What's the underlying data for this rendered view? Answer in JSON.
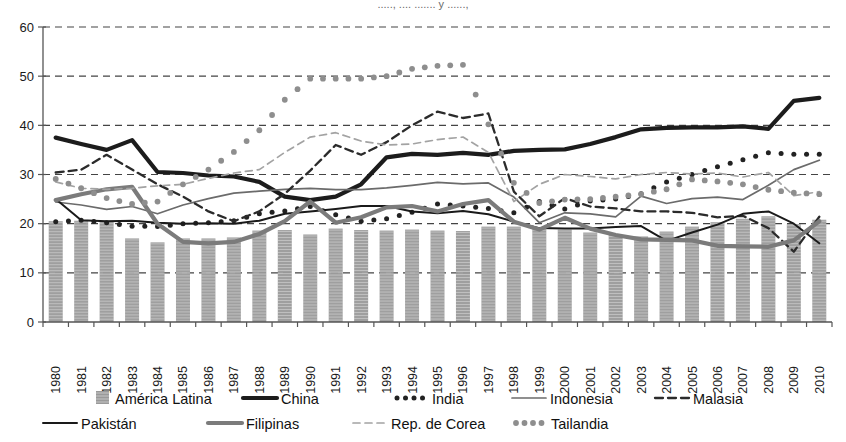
{
  "title_truncated": "....., .... ....... y ......,",
  "chart_data": {
    "type": "line",
    "title": "",
    "xlabel": "",
    "ylabel": "",
    "ylim": [
      0,
      60
    ],
    "yticks": [
      0,
      10,
      20,
      30,
      40,
      50,
      60
    ],
    "grid": true,
    "legend_position": "bottom",
    "categories": [
      "1980",
      "1981",
      "1982",
      "1983",
      "1984",
      "1985",
      "1986",
      "1987",
      "1988",
      "1989",
      "1990",
      "1991",
      "1992",
      "1993",
      "1994",
      "1995",
      "1996",
      "1997",
      "1998",
      "1999",
      "2000",
      "2001",
      "2002",
      "2003",
      "2004",
      "2005",
      "2006",
      "2007",
      "2008",
      "2009",
      "2010"
    ],
    "series": [
      {
        "name": "América Latina",
        "type": "bar",
        "style": "bar-gray-hatch",
        "color": "#9a9a9a",
        "values": [
          20.5,
          20.6,
          20.4,
          17.0,
          16.2,
          17.0,
          17.0,
          17.2,
          18.6,
          18.7,
          17.8,
          19.0,
          18.7,
          18.6,
          18.8,
          18.6,
          18.5,
          19.4,
          19.4,
          19.0,
          18.8,
          18.2,
          17.7,
          17.4,
          18.4,
          19.4,
          20.3,
          21.0,
          21.5,
          19.9,
          20.8
        ]
      },
      {
        "name": "China",
        "type": "line",
        "style": "solid-thick-black",
        "color": "#1c1c1c",
        "values": [
          37.5,
          36.2,
          35.0,
          37.0,
          30.5,
          30.3,
          29.8,
          29.6,
          28.5,
          25.5,
          24.8,
          25.5,
          28.0,
          33.5,
          34.2,
          34.0,
          34.4,
          34.0,
          34.8,
          35.0,
          35.1,
          36.2,
          37.6,
          39.2,
          39.5,
          39.6,
          39.6,
          39.8,
          39.3,
          45.0,
          45.6
        ]
      },
      {
        "name": "India",
        "type": "line",
        "style": "dotted-thick-black",
        "color": "#222222",
        "values": [
          20.4,
          20.7,
          20.2,
          19.5,
          19.4,
          20.0,
          20.2,
          20.6,
          22.0,
          22.6,
          23.5,
          21.8,
          20.5,
          21.0,
          22.3,
          24.0,
          23.6,
          23.1,
          22.2,
          24.5,
          23.0,
          24.6,
          25.0,
          26.1,
          28.5,
          30.0,
          31.6,
          33.0,
          34.4,
          34.1,
          34.1
        ]
      },
      {
        "name": "Indonesia",
        "type": "line",
        "style": "solid-thin-gray",
        "color": "#6b6b6b",
        "values": [
          24.4,
          23.8,
          22.9,
          23.5,
          22.0,
          23.8,
          25.1,
          26.2,
          26.6,
          27.0,
          27.2,
          26.9,
          26.9,
          27.3,
          27.8,
          28.4,
          28.1,
          28.3,
          25.4,
          20.2,
          22.2,
          22.0,
          21.4,
          25.6,
          24.1,
          25.1,
          25.4,
          24.9,
          27.8,
          31.0,
          32.9
        ]
      },
      {
        "name": "Malasia",
        "type": "line",
        "style": "dashed-dark",
        "color": "#2b2b2b",
        "values": [
          30.4,
          31.0,
          34.0,
          31.0,
          28.0,
          25.5,
          22.5,
          20.5,
          22.5,
          26.1,
          30.8,
          36.0,
          34.0,
          36.6,
          40.0,
          42.8,
          41.5,
          42.4,
          26.5,
          21.5,
          25.2,
          23.5,
          23.1,
          22.5,
          22.5,
          22.2,
          21.3,
          21.6,
          19.1,
          14.3,
          21.4
        ]
      },
      {
        "name": "Pakistán",
        "type": "line",
        "style": "solid-thin-black",
        "color": "#1a1a1a",
        "values": [
          25.0,
          20.7,
          20.5,
          20.6,
          20.2,
          20.0,
          20.1,
          20.0,
          20.6,
          22.0,
          22.5,
          23.0,
          23.6,
          23.6,
          22.5,
          22.1,
          22.6,
          21.9,
          20.4,
          19.1,
          19.0,
          19.0,
          19.3,
          19.5,
          16.5,
          18.2,
          19.8,
          22.0,
          22.5,
          20.0,
          16.0
        ]
      },
      {
        "name": "Filipinas",
        "type": "line",
        "style": "solid-thick-gray",
        "color": "#7b7b7b",
        "values": [
          24.8,
          26.0,
          27.0,
          27.5,
          20.0,
          16.3,
          16.0,
          16.3,
          17.9,
          20.5,
          24.5,
          20.2,
          21.3,
          23.3,
          23.6,
          22.5,
          24.0,
          24.8,
          20.4,
          18.8,
          21.2,
          19.0,
          17.7,
          16.8,
          16.7,
          16.6,
          15.5,
          15.4,
          15.3,
          16.6,
          20.5
        ]
      },
      {
        "name": "Rep. de Corea",
        "type": "line",
        "style": "dashed-light",
        "color": "#a3a3a3",
        "values": [
          28.5,
          27.2,
          27.0,
          27.2,
          27.7,
          28.0,
          29.2,
          30.3,
          31.0,
          34.5,
          37.6,
          38.5,
          36.8,
          36.0,
          36.2,
          37.1,
          37.6,
          34.5,
          24.5,
          28.0,
          30.0,
          29.6,
          29.1,
          30.0,
          30.4,
          30.1,
          30.3,
          29.5,
          30.4,
          25.7,
          26.5
        ]
      },
      {
        "name": "Tailandia",
        "type": "line",
        "style": "dotted-thick-gray",
        "color": "#8e8e8e",
        "values": [
          29.1,
          27.2,
          25.2,
          24.0,
          24.5,
          28.0,
          31.0,
          34.6,
          39.0,
          45.2,
          49.5,
          49.5,
          49.5,
          50.0,
          51.5,
          52.1,
          52.3,
          40.2,
          28.3,
          24.2,
          24.9,
          25.0,
          25.5,
          26.0,
          27.0,
          29.0,
          28.6,
          28.0,
          26.9,
          26.3,
          26.0
        ]
      }
    ],
    "legend": [
      {
        "label": "América Latina",
        "marker": "bar-gray-hatch",
        "color": "#9a9a9a"
      },
      {
        "label": "China",
        "marker": "solid-thick-black",
        "color": "#1c1c1c"
      },
      {
        "label": "India",
        "marker": "dotted-thick-black",
        "color": "#222222"
      },
      {
        "label": "Indonesia",
        "marker": "solid-thin-gray",
        "color": "#6b6b6b"
      },
      {
        "label": "Malasia",
        "marker": "dashed-dark",
        "color": "#2b2b2b"
      },
      {
        "label": "Pakistán",
        "marker": "solid-thin-black",
        "color": "#1a1a1a"
      },
      {
        "label": "Filipinas",
        "marker": "solid-thick-gray",
        "color": "#7b7b7b"
      },
      {
        "label": "Rep. de Corea",
        "marker": "dashed-light",
        "color": "#a3a3a3"
      },
      {
        "label": "Tailandia",
        "marker": "dotted-thick-gray",
        "color": "#8e8e8e"
      }
    ]
  }
}
